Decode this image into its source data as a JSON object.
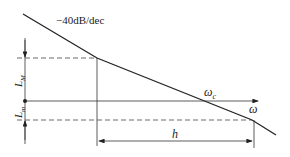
{
  "diagram": {
    "slope_label": "−40dB/dec",
    "omega_c_label": "ω",
    "omega_c_sub": "c",
    "omega_label": "ω",
    "LM_label": "L",
    "LM_sub": "M",
    "Lm_label": "L",
    "Lm_sub": "m",
    "h_label": "h",
    "colors": {
      "line": "#222222",
      "background": "#ffffff"
    }
  }
}
